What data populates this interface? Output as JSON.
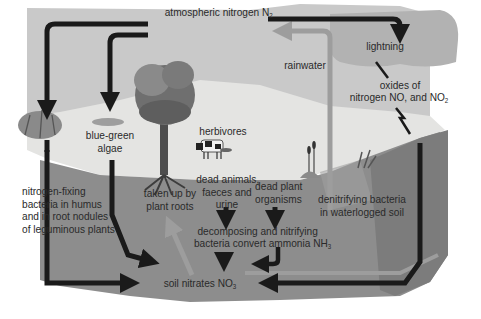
{
  "diagram": {
    "labels": {
      "atmospheric": {
        "text": "atmospheric nitrogen N",
        "sub": "2"
      },
      "lightning": "lightning",
      "oxides_line1": "oxides of",
      "oxides_line2": {
        "text": "nitrogen NO, and NO",
        "sub": "2"
      },
      "rainwater": "rainwater",
      "blue_green_algae": [
        "blue-green",
        "algae"
      ],
      "herbivores": "herbivores",
      "nitrogen_fixing": [
        "nitrogen-fixing",
        "bacteria in humus",
        "and in root nodules",
        "of leguminous plants"
      ],
      "taken_up": [
        "taken up by",
        "plant roots"
      ],
      "dead_animals": [
        "dead animals,",
        "faeces and",
        "urine"
      ],
      "dead_plant": [
        "dead plant",
        "organisms"
      ],
      "denitrifying": [
        "denitrifying bacteria",
        "in waterlogged soil"
      ],
      "decomposing_line1": "decomposing and nitrifying",
      "decomposing_line2": {
        "text": "bacteria convert ammonia NH",
        "sub": "3"
      },
      "soil_nitrates": {
        "text": "soil nitrates NO",
        "sub": "3"
      }
    },
    "colors": {
      "sky": "#c9c9c9",
      "cloud": "#b0b0b0",
      "surface": "#e4e4e2",
      "soil": "#8c8c8c",
      "soil_dark": "#7a7a7a",
      "arrow_dark": "#1a1a1a",
      "arrow_light": "#9d9d9d"
    }
  }
}
